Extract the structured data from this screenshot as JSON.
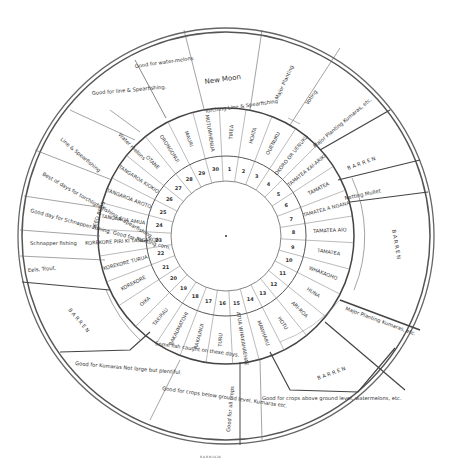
{
  "center": {
    "x": 226,
    "y": 236
  },
  "rings": {
    "inner_r": 55,
    "day_r": 80,
    "name_r": 128,
    "outer_r": 200,
    "border_r": 206
  },
  "days": [
    {
      "n": "1",
      "name": "Tirea"
    },
    {
      "n": "2",
      "name": "Hoata"
    },
    {
      "n": "3",
      "name": "Ouenuku"
    },
    {
      "n": "4",
      "name": "Okoro or Uenuku"
    },
    {
      "n": "5",
      "name": "Tamatea Kai-ariki"
    },
    {
      "n": "6",
      "name": "Tamatea"
    },
    {
      "n": "7",
      "name": "Tamatea a ngana"
    },
    {
      "n": "8",
      "name": "Tamatea aio"
    },
    {
      "n": "9",
      "name": "Tamatea"
    },
    {
      "n": "10",
      "name": "Whakaoho"
    },
    {
      "n": "11",
      "name": "Huna"
    },
    {
      "n": "12",
      "name": "Ari-roa"
    },
    {
      "n": "13",
      "name": "Hotu"
    },
    {
      "n": "14",
      "name": "Mawharu"
    },
    {
      "n": "15",
      "name": "Atua whakahaehae"
    },
    {
      "n": "16",
      "name": "Turu"
    },
    {
      "n": "17",
      "name": "Rakaunui"
    },
    {
      "n": "18",
      "name": "Rakaumatohi"
    },
    {
      "n": "19",
      "name": "Takirau"
    },
    {
      "n": "20",
      "name": "Oika"
    },
    {
      "n": "21",
      "name": "Korekore"
    },
    {
      "n": "22",
      "name": "Korekore turua"
    },
    {
      "n": "23",
      "name": "Korekore piri ki Tangaroa"
    },
    {
      "n": "24",
      "name": "Tangaroa amua"
    },
    {
      "n": "25",
      "name": "Tangaroa aroto"
    },
    {
      "n": "26",
      "name": "Tangaroa kiokio"
    },
    {
      "n": "27",
      "name": "Otane"
    },
    {
      "n": "28",
      "name": "Orongonui"
    },
    {
      "n": "29",
      "name": "Mauri"
    },
    {
      "n": "30",
      "name": "Mutuwhenua"
    }
  ],
  "activities": [
    {
      "text": "New Moon",
      "style": "big"
    },
    {
      "text": "Torching Line & Spearfishing"
    },
    {
      "text": "Major Planting"
    },
    {
      "text": "Voting"
    },
    {
      "text": "Major Planting Kumaras, etc."
    },
    {
      "text": "B A R R E N"
    },
    {
      "text": "Netting Mullet"
    },
    {
      "text": "B A R R E N"
    },
    {
      "text": "Major Planting Kumaras, etc."
    },
    {
      "text": "B A R R E N"
    },
    {
      "text": "Good for crops above ground level, watermelons, etc."
    },
    {
      "text": "Good for all crops"
    },
    {
      "text": "Good for crops below ground level. Kumaras etc."
    },
    {
      "text": "Some fish caught on these days."
    },
    {
      "text": "Good for Kumaras Not large but plentiful."
    },
    {
      "text": "B A R R E N"
    },
    {
      "text": "Eels, Trout."
    },
    {
      "text": "Schnapper fishing"
    },
    {
      "text": "Good day for Schnapper fishing. Good for Planting corn."
    },
    {
      "text": "Best of days for torchlight fishing & spearfishing."
    },
    {
      "text": "SEED BEDS"
    },
    {
      "text": "Line & Spearfishing"
    },
    {
      "text": "Good for line & Spearfishing."
    },
    {
      "text": "Water melons"
    },
    {
      "text": "Good for water-melons"
    }
  ],
  "footer": {
    "caption": "B.A.R.N.14.28"
  }
}
